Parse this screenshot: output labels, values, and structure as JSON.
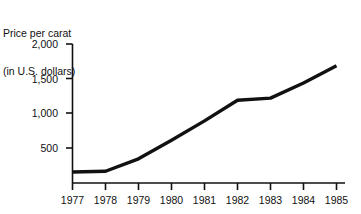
{
  "chart_data": {
    "type": "line",
    "title": "Price per carat\n(in U.S. dollars)",
    "title_line1": "Price per carat",
    "title_line2": "(in U.S. dollars)",
    "xlabel": "",
    "ylabel": "Price per carat (in U.S. dollars)",
    "categories": [
      "1977",
      "1978",
      "1979",
      "1980",
      "1981",
      "1982",
      "1983",
      "1984",
      "1985"
    ],
    "x": [
      1977,
      1978,
      1979,
      1980,
      1981,
      1982,
      1983,
      1984,
      1985
    ],
    "values": [
      160,
      170,
      350,
      620,
      900,
      1200,
      1230,
      1450,
      1700
    ],
    "series": [
      {
        "name": "Price per carat",
        "values": [
          160,
          170,
          350,
          620,
          900,
          1200,
          1230,
          1450,
          1700
        ]
      }
    ],
    "ylim": [
      0,
      2000
    ],
    "yticks": [
      500,
      1000,
      1500,
      2000
    ],
    "ytick_labels": [
      "500",
      "1,000",
      "1,500",
      "2,000"
    ],
    "xtick_labels": [
      "1977",
      "1978",
      "1979",
      "1980",
      "1981",
      "1982",
      "1983",
      "1984",
      "1985"
    ],
    "grid": false,
    "legend": "none",
    "line_color": "#111111",
    "axis_color": "#111111",
    "background_color": "#ffffff"
  },
  "axis": {
    "y_labels": [
      "2,000",
      "1,500",
      "1,000",
      "500"
    ],
    "x_labels": [
      "1977",
      "1978",
      "1979",
      "1980",
      "1981",
      "1982",
      "1983",
      "1984",
      "1985"
    ]
  }
}
